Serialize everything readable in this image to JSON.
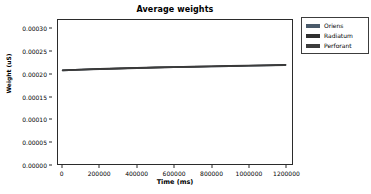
{
  "chart_data": {
    "type": "line",
    "title": "Average weights",
    "xlabel": "Time (ms)",
    "ylabel": "Weight (uS)",
    "xlim": [
      -25000,
      1235000
    ],
    "ylim": [
      0.0,
      0.00032
    ],
    "grid": false,
    "legend_position": "upper right outside",
    "xticks": [
      0,
      200000,
      400000,
      600000,
      800000,
      1000000,
      1200000
    ],
    "xticklabels": [
      "0",
      "200000",
      "400000",
      "600000",
      "800000",
      "1000000",
      "1200000"
    ],
    "yticks": [
      0.0,
      5e-05,
      0.0001,
      0.00015,
      0.0002,
      0.00025,
      0.0003
    ],
    "yticklabels": [
      "0.00000",
      "0.00005",
      "0.00010",
      "0.00015",
      "0.00020",
      "0.00025",
      "0.00030"
    ],
    "x": [
      0,
      100000,
      200000,
      300000,
      400000,
      500000,
      600000,
      700000,
      800000,
      900000,
      1000000,
      1100000,
      1200000
    ],
    "series": [
      {
        "name": "Oriens",
        "color": "#4a5a6a",
        "values": [
          0.000208,
          0.0002097,
          0.000211,
          0.0002122,
          0.0002133,
          0.0002143,
          0.0002152,
          0.000216,
          0.0002168,
          0.0002176,
          0.0002184,
          0.0002192,
          0.00022
        ]
      },
      {
        "name": "Radiatum",
        "color": "#2f2f2f",
        "values": [
          0.0002084,
          0.0002101,
          0.0002114,
          0.0002126,
          0.0002137,
          0.0002147,
          0.0002156,
          0.0002164,
          0.0002172,
          0.000218,
          0.0002188,
          0.0002196,
          0.0002204
        ]
      },
      {
        "name": "Perforant",
        "color": "#3c3c3c",
        "values": [
          0.0002078,
          0.0002095,
          0.0002108,
          0.000212,
          0.0002131,
          0.0002141,
          0.000215,
          0.0002158,
          0.0002166,
          0.0002174,
          0.0002182,
          0.000219,
          0.0002198
        ]
      }
    ]
  },
  "legend": {
    "items": [
      {
        "label": "Oriens",
        "color": "#4a5a6a"
      },
      {
        "label": "Radiatum",
        "color": "#2f2f2f"
      },
      {
        "label": "Perforant",
        "color": "#3c3c3c"
      }
    ]
  }
}
